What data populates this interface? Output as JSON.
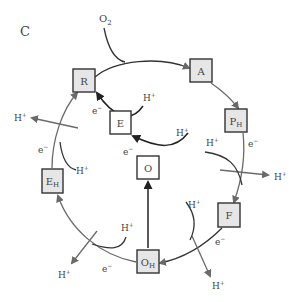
{
  "panel": {
    "label": "C"
  },
  "inputs": {
    "oxygen": "O",
    "oxygen_sub": "2"
  },
  "states": {
    "R": {
      "label": "R",
      "sub": ""
    },
    "A": {
      "label": "A",
      "sub": ""
    },
    "PH": {
      "label": "P",
      "sub": "H"
    },
    "F": {
      "label": "F",
      "sub": ""
    },
    "OH": {
      "label": "O",
      "sub": "H"
    },
    "EH": {
      "label": "E",
      "sub": "H"
    },
    "E": {
      "label": "E",
      "sub": ""
    },
    "O": {
      "label": "O",
      "sub": ""
    }
  },
  "species": {
    "proton": "H",
    "proton_sup": "+",
    "electron": "e",
    "electron_sup": "−"
  },
  "colors": {
    "box_fill": "#e6e6e6",
    "box_white": "#ffffff",
    "stroke_dark": "#333333",
    "stroke_gray": "#6a6a6a"
  }
}
